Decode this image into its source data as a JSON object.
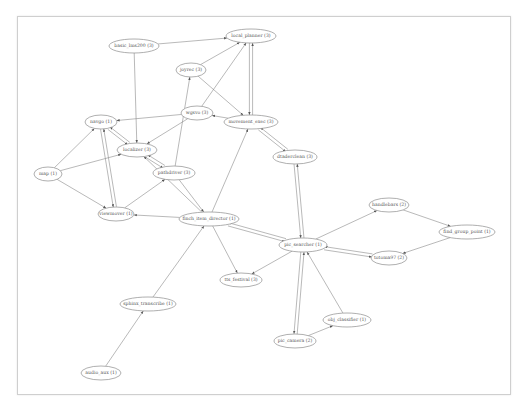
{
  "graph": {
    "frame": {
      "x": 17,
      "y": 16,
      "width": 492,
      "height": 377
    },
    "nodes": [
      {
        "id": "basic_lms200",
        "label": "basic_lms200 (3)",
        "x": 134,
        "y": 46,
        "rx": 25,
        "ry": 7
      },
      {
        "id": "local_planner",
        "label": "local_planner (3)",
        "x": 251,
        "y": 36,
        "rx": 25,
        "ry": 7
      },
      {
        "id": "joyrec",
        "label": "joyrec (3)",
        "x": 191,
        "y": 70,
        "rx": 15,
        "ry": 7
      },
      {
        "id": "wgsvo",
        "label": "wgsvo (3)",
        "x": 197,
        "y": 113,
        "rx": 16,
        "ry": 7
      },
      {
        "id": "movement_exec",
        "label": "movement_exec (3)",
        "x": 251,
        "y": 122,
        "rx": 27,
        "ry": 7
      },
      {
        "id": "navgo",
        "label": "navgo (1)",
        "x": 101,
        "y": 122,
        "rx": 16,
        "ry": 7
      },
      {
        "id": "localizer",
        "label": "localizer (3)",
        "x": 137,
        "y": 150,
        "rx": 20,
        "ry": 7
      },
      {
        "id": "map",
        "label": "map (1)",
        "x": 48,
        "y": 174,
        "rx": 14,
        "ry": 7
      },
      {
        "id": "pathdriver",
        "label": "pathdriver (3)",
        "x": 174,
        "y": 173,
        "rx": 21,
        "ry": 7
      },
      {
        "id": "viewmover",
        "label": "viewmover (1)",
        "x": 116,
        "y": 214,
        "rx": 18,
        "ry": 7
      },
      {
        "id": "dtaderclean",
        "label": "dtaderclean (3)",
        "x": 295,
        "y": 157,
        "rx": 22,
        "ry": 7
      },
      {
        "id": "finch_item_director",
        "label": "finch_item_director (1)",
        "x": 209,
        "y": 219,
        "rx": 30,
        "ry": 7
      },
      {
        "id": "pic_searcher",
        "label": "pic_searcher (1)",
        "x": 303,
        "y": 245,
        "rx": 24,
        "ry": 7
      },
      {
        "id": "tts_festival",
        "label": "tts_festival (3)",
        "x": 241,
        "y": 280,
        "rx": 21,
        "ry": 7
      },
      {
        "id": "handlebars",
        "label": "handlebars (2)",
        "x": 389,
        "y": 205,
        "rx": 20,
        "ry": 7
      },
      {
        "id": "find_group_point",
        "label": "find_group_point (1)",
        "x": 467,
        "y": 232,
        "rx": 28,
        "ry": 7
      },
      {
        "id": "totoma97",
        "label": "totoma97 (2)",
        "x": 389,
        "y": 258,
        "rx": 18,
        "ry": 7
      },
      {
        "id": "pic_camera",
        "label": "pic_camera (2)",
        "x": 295,
        "y": 341,
        "rx": 21,
        "ry": 7
      },
      {
        "id": "obj_classifier",
        "label": "obj_classifier (1)",
        "x": 347,
        "y": 320,
        "rx": 24,
        "ry": 7
      },
      {
        "id": "sphinx_transcribe",
        "label": "sphinx_transcribe (1)",
        "x": 148,
        "y": 304,
        "rx": 28,
        "ry": 7
      },
      {
        "id": "audio_aux",
        "label": "audio_aux (1)",
        "x": 101,
        "y": 373,
        "rx": 20,
        "ry": 7
      }
    ],
    "edges": [
      [
        "basic_lms200",
        "local_planner"
      ],
      [
        "basic_lms200",
        "localizer"
      ],
      [
        "joyrec",
        "local_planner"
      ],
      [
        "movement_exec",
        "local_planner"
      ],
      [
        "local_planner",
        "movement_exec"
      ],
      [
        "joyrec",
        "movement_exec"
      ],
      [
        "wgsvo",
        "local_planner"
      ],
      [
        "movement_exec",
        "wgsvo"
      ],
      [
        "wgsvo",
        "navgo"
      ],
      [
        "wgsvo",
        "localizer"
      ],
      [
        "movement_exec",
        "dtaderclean"
      ],
      [
        "dtaderclean",
        "movement_exec"
      ],
      [
        "localizer",
        "navgo"
      ],
      [
        "navgo",
        "localizer"
      ],
      [
        "map",
        "navgo"
      ],
      [
        "map",
        "localizer"
      ],
      [
        "map",
        "viewmover"
      ],
      [
        "viewmover",
        "navgo"
      ],
      [
        "navgo",
        "viewmover"
      ],
      [
        "localizer",
        "pathdriver"
      ],
      [
        "pathdriver",
        "localizer"
      ],
      [
        "pathdriver",
        "joyrec"
      ],
      [
        "pathdriver",
        "finch_item_director"
      ],
      [
        "finch_item_director",
        "localizer"
      ],
      [
        "viewmover",
        "pathdriver"
      ],
      [
        "finch_item_director",
        "viewmover"
      ],
      [
        "finch_item_director",
        "movement_exec"
      ],
      [
        "finch_item_director",
        "pic_searcher"
      ],
      [
        "pic_searcher",
        "finch_item_director"
      ],
      [
        "finch_item_director",
        "tts_festival"
      ],
      [
        "pic_searcher",
        "tts_festival"
      ],
      [
        "dtaderclean",
        "pic_searcher"
      ],
      [
        "pic_searcher",
        "dtaderclean"
      ],
      [
        "pic_searcher",
        "handlebars"
      ],
      [
        "handlebars",
        "find_group_point"
      ],
      [
        "find_group_point",
        "totoma97"
      ],
      [
        "pic_searcher",
        "totoma97"
      ],
      [
        "totoma97",
        "pic_searcher"
      ],
      [
        "pic_searcher",
        "pic_camera"
      ],
      [
        "pic_camera",
        "pic_searcher"
      ],
      [
        "obj_classifier",
        "pic_searcher"
      ],
      [
        "pic_camera",
        "obj_classifier"
      ],
      [
        "sphinx_transcribe",
        "finch_item_director"
      ],
      [
        "audio_aux",
        "sphinx_transcribe"
      ]
    ]
  }
}
